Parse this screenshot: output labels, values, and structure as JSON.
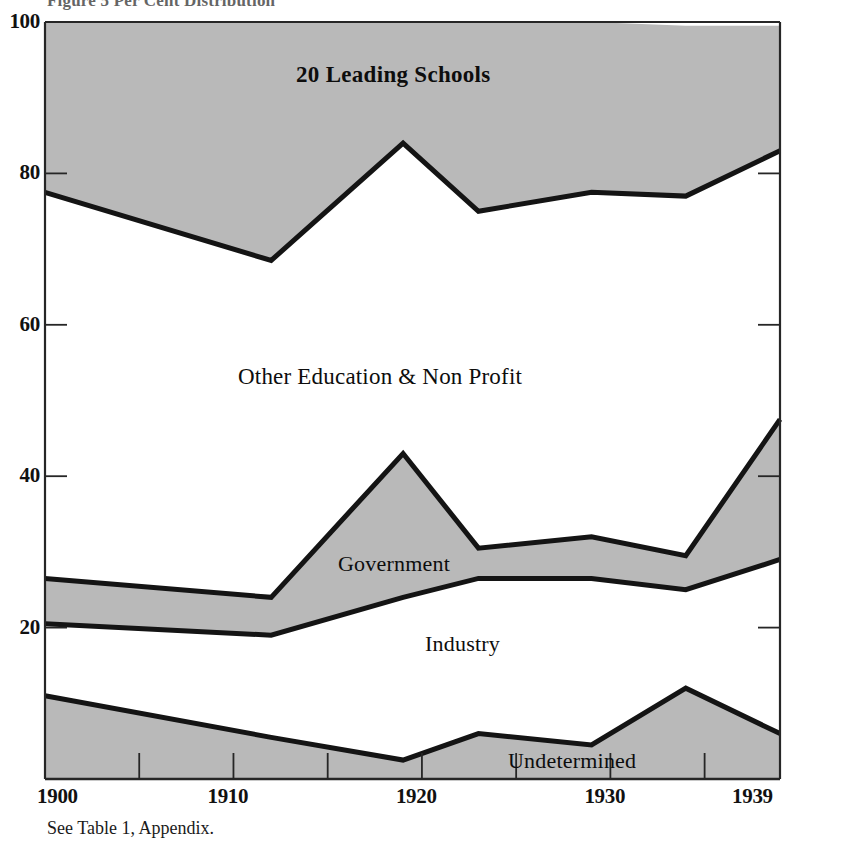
{
  "figure": {
    "title": "Figure 5  Per Cent Distribution",
    "source_note": "See Table 1, Appendix."
  },
  "axes": {
    "y_ticks": [
      "100",
      "80",
      "60",
      "40",
      "20"
    ],
    "x_ticks": [
      "1900",
      "1910",
      "1920",
      "1930",
      "1939"
    ]
  },
  "labels": {
    "schools": "20 Leading Schools",
    "other_education": "Other Education & Non Profit",
    "government": "Government",
    "industry": "Industry",
    "undetermined": "Undetermined"
  },
  "colors": {
    "band_fill": "#b9b9b9",
    "line": "#141414",
    "axis": "#262626",
    "background": "#ffffff"
  },
  "chart_data": {
    "type": "area",
    "title": "Figure 5  Per Cent Distribution",
    "xlabel": "",
    "ylabel": "Per Cent",
    "xlim": [
      1900,
      1939
    ],
    "ylim": [
      0,
      100
    ],
    "grid": false,
    "stacked": true,
    "legend": "in-plot band labels",
    "x": [
      1900,
      1912,
      1919,
      1923,
      1929,
      1934,
      1939
    ],
    "series": [
      {
        "name": "Undetermined",
        "fill": "#b9b9b9",
        "values": [
          11.0,
          5.5,
          2.5,
          6.0,
          4.5,
          12.0,
          6.0
        ]
      },
      {
        "name": "Industry",
        "fill": "#ffffff",
        "values": [
          9.5,
          13.5,
          21.5,
          20.5,
          22.0,
          13.0,
          23.0
        ]
      },
      {
        "name": "Government",
        "fill": "#b9b9b9",
        "values": [
          6.0,
          5.0,
          19.0,
          4.0,
          5.5,
          4.5,
          18.5
        ]
      },
      {
        "name": "Other Education & Non Profit",
        "fill": "#ffffff",
        "values": [
          51.0,
          44.5,
          41.0,
          44.5,
          45.5,
          47.5,
          35.5
        ]
      },
      {
        "name": "20 Leading Schools",
        "fill": "#b9b9b9",
        "values": [
          22.5,
          31.5,
          16.0,
          25.0,
          22.5,
          22.5,
          16.5
        ]
      }
    ],
    "cumulative_boundaries": {
      "undetermined_top": [
        11.0,
        5.5,
        2.5,
        6.0,
        4.5,
        12.0,
        6.0
      ],
      "industry_top": [
        20.5,
        19.0,
        24.0,
        26.5,
        26.5,
        25.0,
        29.0
      ],
      "government_top": [
        26.5,
        24.0,
        43.0,
        30.5,
        32.0,
        29.5,
        47.5
      ],
      "education_top": [
        77.5,
        68.5,
        84.0,
        75.0,
        77.5,
        77.0,
        83.0
      ],
      "total_top": [
        100,
        100,
        100,
        100,
        100,
        100,
        100
      ]
    }
  }
}
